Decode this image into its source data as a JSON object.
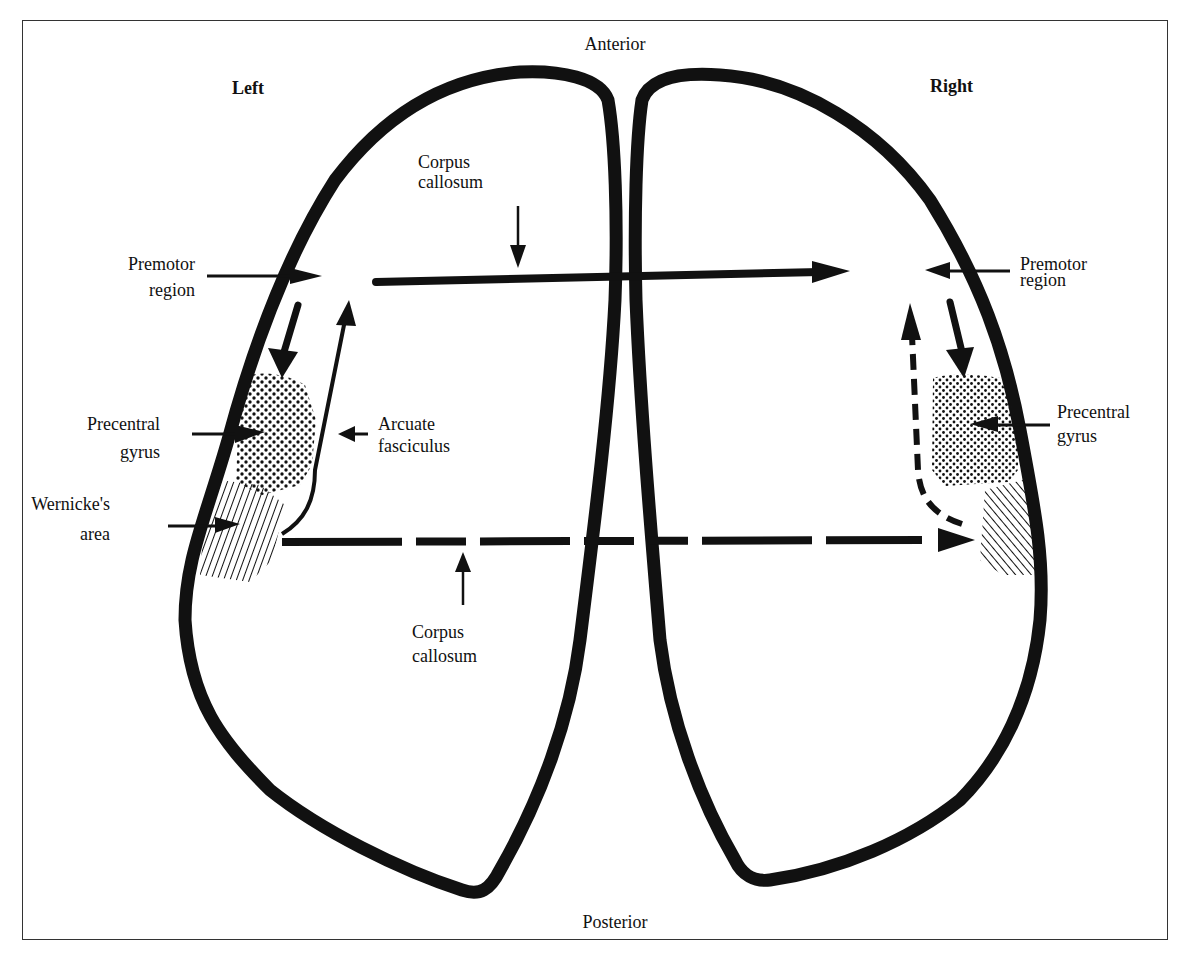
{
  "orientation": {
    "top": "Anterior",
    "bottom": "Posterior"
  },
  "hemispheres": {
    "left": {
      "title": "Left",
      "labels": {
        "premotor_l1": "Premotor",
        "premotor_l2": "region",
        "precentral_l1": "Precentral",
        "precentral_l2": "gyrus",
        "wernicke_l1": "Wernicke's",
        "wernicke_l2": "area",
        "arcuate_l1": "Arcuate",
        "arcuate_l2": "fasciculus"
      }
    },
    "right": {
      "title": "Right",
      "labels": {
        "premotor_l1": "Premotor",
        "premotor_l2": "region",
        "precentral_l1": "Precentral",
        "precentral_l2": "gyrus"
      }
    }
  },
  "corpus_callosum": {
    "top_l1": "Corpus",
    "top_l2": "callosum",
    "bottom_l1": "Corpus",
    "bottom_l2": "callosum"
  },
  "colors": {
    "ink": "#111111",
    "paper": "#ffffff"
  }
}
